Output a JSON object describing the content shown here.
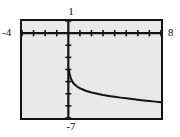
{
  "figure": {
    "kind": "graphing-calculator-plot",
    "background_color": "#ffffff",
    "plot_background_color": "#e9e9e9",
    "frame_color": "#141414",
    "axis_color": "#141414",
    "curve_color": "#141414"
  },
  "labels": {
    "x_min": "-4",
    "x_max": "8",
    "y_max": "1",
    "y_min": "-7"
  },
  "chart_data": {
    "type": "line",
    "title": "",
    "subtitle": "",
    "xlabel": "",
    "ylabel": "",
    "xlim": [
      -4,
      8
    ],
    "ylim": [
      -7,
      1
    ],
    "grid": false,
    "legend": "none",
    "axes": {
      "x_axis_at_y": 0,
      "y_axis_at_x": 0,
      "x_tick_step": 1,
      "y_tick_step": 1,
      "x_ticks": [
        -4,
        -3,
        -2,
        -1,
        0,
        1,
        2,
        3,
        4,
        5,
        6,
        7,
        8
      ],
      "y_ticks": [
        -7,
        -6,
        -5,
        -4,
        -3,
        -2,
        -1,
        0,
        1
      ],
      "tick_labels_shown": false
    },
    "annotations": [
      "vertical asymptote at x = 0",
      "curve decreasing for x > 0"
    ],
    "series": [
      {
        "name": "curve",
        "domain": [
          0.06,
          8
        ],
        "x": [
          0.06,
          0.1,
          0.2,
          0.35,
          0.5,
          0.75,
          1.0,
          1.5,
          2.0,
          2.5,
          3.0,
          3.5,
          4.0,
          4.5,
          5.0,
          5.5,
          6.0,
          6.5,
          7.0,
          7.5,
          8.0
        ],
        "y": [
          -3.1,
          -3.3,
          -3.7,
          -4.0,
          -4.2,
          -4.4,
          -4.55,
          -4.75,
          -4.9,
          -5.0,
          -5.1,
          -5.18,
          -5.25,
          -5.32,
          -5.38,
          -5.44,
          -5.5,
          -5.55,
          -5.6,
          -5.65,
          -5.7
        ]
      }
    ]
  }
}
